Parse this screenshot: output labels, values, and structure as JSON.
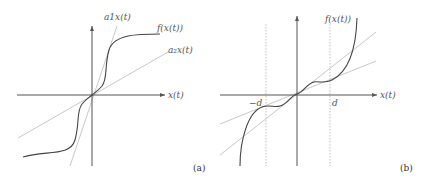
{
  "figure": {
    "panel_a": {
      "id": "(a)",
      "x_axis_label": "x(t)",
      "curve_label": "f(x(t))",
      "steep_line_label": "a1x(t)",
      "shallow_line_label": "a₂x(t)"
    },
    "panel_b": {
      "id": "(b)",
      "x_axis_label": "x(t)",
      "curve_label": "f(x(t))",
      "neg_d_label": "−d",
      "pos_d_label": "d"
    },
    "colors": {
      "axis": "#555555",
      "curve": "#444444",
      "guide_lines": "#c8c8c8",
      "dashed_lines": "#b0b0b0"
    }
  }
}
